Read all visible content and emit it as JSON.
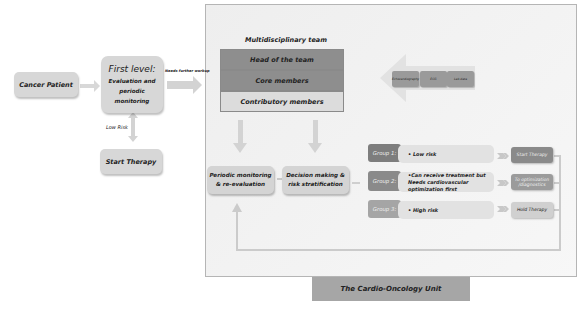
{
  "left_flow": {
    "cancer_patient": "Cancer Patient",
    "first_level_title": "First level:",
    "first_level_subtitle": "Evaluation and periodic monitoring",
    "needs_further_workup": "Needs further workup",
    "low_risk_label": "Low Risk",
    "start_therapy": "Start Therapy"
  },
  "team": {
    "title": "Multidisciplinary team",
    "rows": [
      {
        "label": "Head of the team"
      },
      {
        "label": "Core members"
      },
      {
        "label": "Contributory members"
      }
    ]
  },
  "tests": [
    {
      "label": "Echocardiography"
    },
    {
      "label": "ECG"
    },
    {
      "label": "Lab data"
    }
  ],
  "process": {
    "periodic_monitoring": "Periodic monitoring & re-evaluation",
    "decision_making": "Decision making & risk stratification"
  },
  "groups": [
    {
      "tag": "Group 1:",
      "description": "• Low risk",
      "outcome": "Start Therapy",
      "tag_color": "#7d7d7d",
      "outcome_color": "#8a8a8a"
    },
    {
      "tag": "Group 2:",
      "description": "•Can receive treatment but Needs cardiovascular optimization first",
      "outcome": "To optimization /diagnostics",
      "tag_color": "#8a8a8a",
      "outcome_color": "#9b9b9b"
    },
    {
      "tag": "Group 3:",
      "description": "• High risk",
      "outcome": "Hold Therapy",
      "tag_color": "#a5a5a5",
      "outcome_color": "#cfcfcf"
    }
  ],
  "footer": {
    "title": "The Cardio-Oncology Unit"
  },
  "colors": {
    "panel_border": "#b5b5b5",
    "arrow": "#d2d2d2",
    "team_dark": "#8e8e8e",
    "team_light": "#dcdcdc",
    "footer_bg": "#a6a6a6"
  }
}
